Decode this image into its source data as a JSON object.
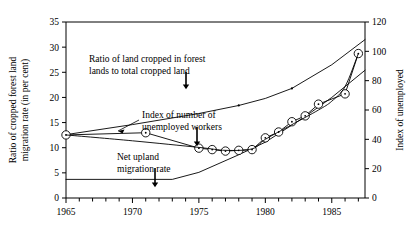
{
  "chart_data": {
    "type": "line",
    "title": "",
    "xlabel": "",
    "ylabel_left": "Ratio of cropped forest land\nmigration  rate (in per cent)",
    "ylabel_right": "Index of unemployed",
    "xlim": [
      1965,
      1987.5
    ],
    "ylim_left": [
      0,
      35
    ],
    "ylim_right": [
      0,
      120
    ],
    "grid": false,
    "legend_position": "none",
    "x_ticks_major": [
      1965,
      1970,
      1975,
      1980,
      1985
    ],
    "x_tick_labels": [
      "1965",
      "1970",
      "1975",
      "1980",
      "1985"
    ],
    "x_ticks_minor": [
      1966,
      1967,
      1968,
      1969,
      1971,
      1972,
      1973,
      1974,
      1976,
      1977,
      1978,
      1979,
      1981,
      1982,
      1983,
      1984,
      1986,
      1987
    ],
    "y_ticks_left": [
      0,
      5,
      10,
      15,
      20,
      25,
      30,
      35
    ],
    "y_tick_labels_left": [
      "0",
      "5",
      "10",
      "15",
      "20",
      "25",
      "30",
      "35"
    ],
    "y_ticks_right": [
      0,
      20,
      40,
      60,
      80,
      100,
      120
    ],
    "y_tick_labels_right": [
      "0",
      "20",
      "40",
      "60",
      "80",
      "100",
      "120"
    ],
    "series": [
      {
        "name": "Ratio of land cropped in forest lands to total cropped land",
        "axis": "left",
        "marker": "none",
        "x": [
          1965,
          1970,
          1975,
          1978,
          1980,
          1982,
          1985,
          1987.5
        ],
        "values": [
          12.6,
          14.6,
          16.8,
          18.4,
          19.8,
          21.8,
          26.5,
          31.5
        ]
      },
      {
        "name": "Net upland migration rate",
        "axis": "left",
        "marker": "none",
        "x": [
          1965,
          1970,
          1973,
          1975,
          1978,
          1980,
          1983,
          1985,
          1987.5
        ],
        "values": [
          3.7,
          3.7,
          3.7,
          5.1,
          8.6,
          11.1,
          16.2,
          20.0,
          25.4
        ]
      },
      {
        "name": "Index of number of unemployed workers",
        "axis": "right",
        "marker": "circle-dot",
        "x": [
          1965,
          1971,
          1975,
          1976,
          1977,
          1978,
          1979,
          1980,
          1981,
          1982,
          1983,
          1984,
          1986,
          1987
        ],
        "values": [
          43.0,
          44.5,
          34.0,
          33.0,
          32.0,
          32.5,
          33.0,
          41.0,
          45.0,
          52.0,
          56.0,
          64.0,
          71.0,
          98.5
        ]
      },
      {
        "name": "Index of unemployed (fitted curve)",
        "axis": "right",
        "marker": "none",
        "x": [
          1965,
          1970,
          1975,
          1977,
          1979,
          1980,
          1982,
          1984,
          1985,
          1986,
          1987
        ],
        "values": [
          43.0,
          39.0,
          34.5,
          32.5,
          33.5,
          40.0,
          50.0,
          60.0,
          66.0,
          76.0,
          98.5
        ]
      }
    ],
    "annotations": [
      {
        "name": "annotation-ratio-forest",
        "text_lines": [
          "Ratio of land cropped in forest",
          "lands to total cropped land"
        ],
        "arrow": "down"
      },
      {
        "name": "annotation-unemployed-index",
        "text_lines": [
          "Index of number of",
          "unemployed workers"
        ],
        "arrow": "down"
      },
      {
        "name": "annotation-net-upland",
        "text_lines": [
          "Net upland",
          "migration rate"
        ],
        "arrow": "down"
      }
    ],
    "colors": {
      "line": "#000000",
      "axis": "#000000",
      "background": "#ffffff",
      "marker_stroke": "#000000",
      "marker_fill": "#ffffff"
    }
  }
}
